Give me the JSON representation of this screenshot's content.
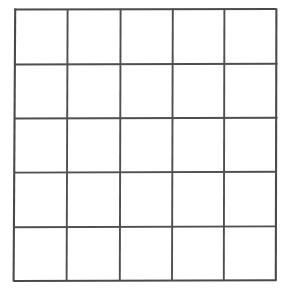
{
  "page": {
    "background_color": "#ffffff",
    "width": 294,
    "height": 291
  },
  "grid": {
    "name": "empty-5x5-grid",
    "rows": 5,
    "columns": 5,
    "cell_count": 25,
    "line_color": "#4f4f4f",
    "border_color": "#4a4a4a",
    "cell_fill_color": "#fefefe",
    "line_width_px": 2,
    "bounds": {
      "left": 14,
      "top": 9,
      "right": 276,
      "bottom": 281
    },
    "vertical_line_x": [
      14,
      67,
      120,
      172,
      224,
      276
    ],
    "horizontal_line_y": [
      9,
      64,
      118,
      172,
      227,
      281
    ],
    "cells": [
      [
        "",
        "",
        "",
        "",
        ""
      ],
      [
        "",
        "",
        "",
        "",
        ""
      ],
      [
        "",
        "",
        "",
        "",
        ""
      ],
      [
        "",
        "",
        "",
        "",
        ""
      ],
      [
        "",
        "",
        "",
        "",
        ""
      ]
    ]
  }
}
